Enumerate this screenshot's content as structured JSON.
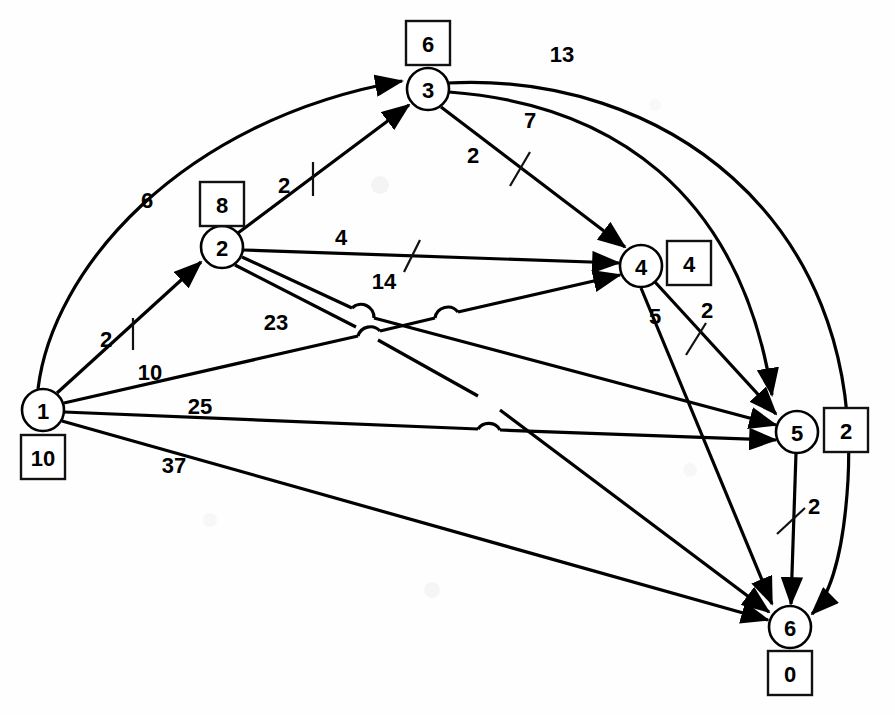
{
  "diagram": {
    "node_shape": "circle",
    "potential_box_shape": "square",
    "stroke_color": "#000000",
    "background_color": "#ffffff"
  },
  "nodes": [
    {
      "id": "1",
      "label": "1",
      "potential": "10",
      "cx": 43,
      "cy": 410,
      "r": 21,
      "box_x": 43,
      "box_y": 457
    },
    {
      "id": "2",
      "label": "2",
      "potential": "8",
      "cx": 222,
      "cy": 247,
      "r": 21,
      "box_x": 222,
      "box_y": 204
    },
    {
      "id": "3",
      "label": "3",
      "potential": "6",
      "cx": 428,
      "cy": 89,
      "r": 21,
      "box_x": 428,
      "box_y": 43
    },
    {
      "id": "4",
      "label": "4",
      "potential": "4",
      "cx": 641,
      "cy": 266,
      "r": 21,
      "box_x": 689,
      "box_y": 263
    },
    {
      "id": "5",
      "label": "5",
      "potential": "2",
      "cx": 797,
      "cy": 432,
      "r": 21,
      "box_x": 846,
      "box_y": 430
    },
    {
      "id": "6",
      "label": "6",
      "potential": "0",
      "cx": 790,
      "cy": 627,
      "r": 21,
      "box_x": 790,
      "box_y": 673
    }
  ],
  "edges": [
    {
      "id": "e1-3",
      "from": "1",
      "to": "3",
      "weight": "6",
      "shape": "curve",
      "label_x": 147,
      "label_y": 200,
      "has_tick": false
    },
    {
      "id": "e1-2",
      "from": "1",
      "to": "2",
      "weight": "2",
      "shape": "line",
      "label_x": 106,
      "label_y": 339,
      "has_tick": true,
      "tick_x": 133,
      "tick_y": 332,
      "tick_angle": 0
    },
    {
      "id": "e1-4",
      "from": "1",
      "to": "4",
      "weight": "10",
      "shape": "line",
      "label_x": 150,
      "label_y": 372,
      "has_tick": false
    },
    {
      "id": "e1-5",
      "from": "1",
      "to": "5",
      "weight": "25",
      "shape": "line",
      "label_x": 200,
      "label_y": 406,
      "has_tick": false
    },
    {
      "id": "e1-6",
      "from": "1",
      "to": "6",
      "weight": "37",
      "shape": "line",
      "label_x": 174,
      "label_y": 465,
      "has_tick": false
    },
    {
      "id": "e2-3",
      "from": "2",
      "to": "3",
      "weight": "2",
      "shape": "line",
      "label_x": 284,
      "label_y": 185,
      "has_tick": true,
      "tick_x": 313,
      "tick_y": 178,
      "tick_angle": 0
    },
    {
      "id": "e2-4",
      "from": "2",
      "to": "4",
      "weight": "4",
      "shape": "line",
      "label_x": 341,
      "label_y": 237,
      "has_tick": true,
      "tick_x": 411,
      "tick_y": 256,
      "tick_angle": 25
    },
    {
      "id": "e2-5",
      "from": "2",
      "to": "5",
      "weight": "14",
      "shape": "line",
      "label_x": 384,
      "label_y": 281,
      "has_tick": false
    },
    {
      "id": "e2-6",
      "from": "2",
      "to": "6",
      "weight": "23",
      "shape": "line",
      "label_x": 276,
      "label_y": 322,
      "has_tick": false
    },
    {
      "id": "e3-4",
      "from": "3",
      "to": "4",
      "weight": "2",
      "shape": "line",
      "label_x": 473,
      "label_y": 155,
      "has_tick": true,
      "tick_x": 518,
      "tick_y": 168,
      "tick_angle": 25
    },
    {
      "id": "e3-5",
      "from": "3",
      "to": "5",
      "weight": "7",
      "shape": "curve",
      "label_x": 530,
      "label_y": 120,
      "has_tick": false
    },
    {
      "id": "e3-6",
      "from": "3",
      "to": "6",
      "weight": "13",
      "shape": "curve",
      "label_x": 562,
      "label_y": 54,
      "has_tick": false
    },
    {
      "id": "e4-5",
      "from": "4",
      "to": "5",
      "weight": "2",
      "shape": "line",
      "label_x": 700,
      "label_y": 312,
      "has_tick": true,
      "tick_x": 695,
      "tick_y": 340,
      "tick_angle": 25
    },
    {
      "id": "e4-6",
      "from": "4",
      "to": "6",
      "weight": "5",
      "shape": "line",
      "label_x": 655,
      "label_y": 316,
      "has_tick": false
    },
    {
      "id": "e5-6",
      "from": "5",
      "to": "6",
      "weight": "2",
      "shape": "line",
      "label_x": 814,
      "label_y": 506,
      "has_tick": true,
      "tick_x": 791,
      "tick_y": 521,
      "tick_angle": 25
    }
  ]
}
